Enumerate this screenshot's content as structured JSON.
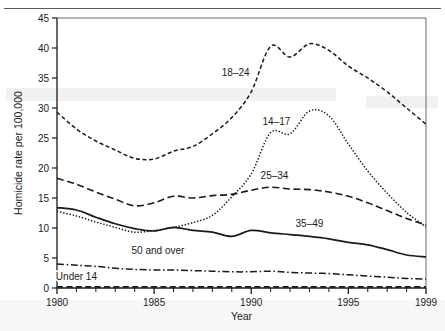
{
  "figure": {
    "top_fragment_text": "",
    "axis_color": "#1a1a1a"
  },
  "axes": {
    "x_title": "Year",
    "y_title": "Homicide rate per 100,000",
    "x_ticklabels": [
      "1980",
      "1985",
      "1990",
      "1995",
      "1999"
    ],
    "y_ticklabels": [
      "0",
      "5",
      "10",
      "15",
      "20",
      "25",
      "30",
      "35",
      "40",
      "45"
    ]
  },
  "series_labels": {
    "s18_24": "18–24",
    "s14_17": "14–17",
    "s25_34": "25–34",
    "s35_49": "35–49",
    "s50plus": "50 and over",
    "sunder14": "Under 14"
  },
  "chart_data": {
    "type": "line",
    "title": "",
    "xlabel": "Year",
    "ylabel": "Homicide rate per 100,000",
    "xlim": [
      1980,
      1999
    ],
    "ylim": [
      0,
      45
    ],
    "yticks": [
      0,
      5,
      10,
      15,
      20,
      25,
      30,
      35,
      40,
      45
    ],
    "xticks": [
      1980,
      1985,
      1990,
      1995,
      1999
    ],
    "minor_xticks_every": 1,
    "grid": false,
    "legend": "inline-annotations",
    "x": [
      1980,
      1981,
      1982,
      1983,
      1984,
      1985,
      1986,
      1987,
      1988,
      1989,
      1990,
      1991,
      1992,
      1993,
      1994,
      1995,
      1996,
      1997,
      1998,
      1999
    ],
    "series": [
      {
        "name": "18–24",
        "linestyle": "dashed",
        "label_x": 1989.2,
        "label_y": 35.4,
        "values": [
          29.3,
          26.5,
          24.5,
          23.0,
          21.6,
          21.5,
          22.8,
          23.6,
          25.7,
          28.4,
          32.7,
          40.3,
          38.5,
          40.7,
          39.6,
          37.0,
          35.0,
          32.7,
          30.0,
          27.3
        ]
      },
      {
        "name": "14–17",
        "linestyle": "dotted",
        "label_x": 1991.3,
        "label_y": 27.2,
        "values": [
          12.8,
          12.0,
          11.0,
          10.1,
          9.3,
          9.6,
          10.1,
          10.9,
          12.1,
          15.2,
          19.0,
          25.9,
          25.7,
          29.5,
          28.7,
          24.0,
          19.5,
          15.8,
          12.6,
          10.2
        ]
      },
      {
        "name": "25–34",
        "linestyle": "dashed-long",
        "label_x": 1991.2,
        "label_y": 18.2,
        "values": [
          18.3,
          17.3,
          16.0,
          14.8,
          13.7,
          14.2,
          15.3,
          15.0,
          15.4,
          15.6,
          16.3,
          16.8,
          16.5,
          16.4,
          16.0,
          15.3,
          14.2,
          12.9,
          11.6,
          10.5
        ]
      },
      {
        "name": "35–49",
        "linestyle": "solid",
        "label_x": 1993.0,
        "label_y": 10.1,
        "values": [
          13.4,
          13.0,
          11.8,
          10.7,
          9.9,
          9.5,
          10.1,
          9.6,
          9.3,
          8.6,
          9.6,
          9.2,
          8.9,
          8.6,
          8.2,
          7.6,
          7.2,
          6.4,
          5.5,
          5.2
        ]
      },
      {
        "name": "50 and over",
        "linestyle": "dashdot",
        "label_x": 1985.2,
        "label_y": 5.6,
        "values": [
          4.0,
          3.8,
          3.6,
          3.3,
          3.1,
          3.0,
          3.0,
          2.9,
          2.8,
          2.7,
          2.7,
          2.8,
          2.6,
          2.5,
          2.4,
          2.2,
          2.0,
          1.8,
          1.6,
          1.5
        ]
      },
      {
        "name": "Under 14",
        "linestyle": "dashed-thick",
        "label_x": 1981.0,
        "label_y": 1.3,
        "values": [
          0.2,
          0.2,
          0.2,
          0.2,
          0.2,
          0.2,
          0.2,
          0.2,
          0.2,
          0.2,
          0.2,
          0.2,
          0.2,
          0.2,
          0.2,
          0.2,
          0.2,
          0.2,
          0.2,
          0.2
        ]
      }
    ]
  }
}
